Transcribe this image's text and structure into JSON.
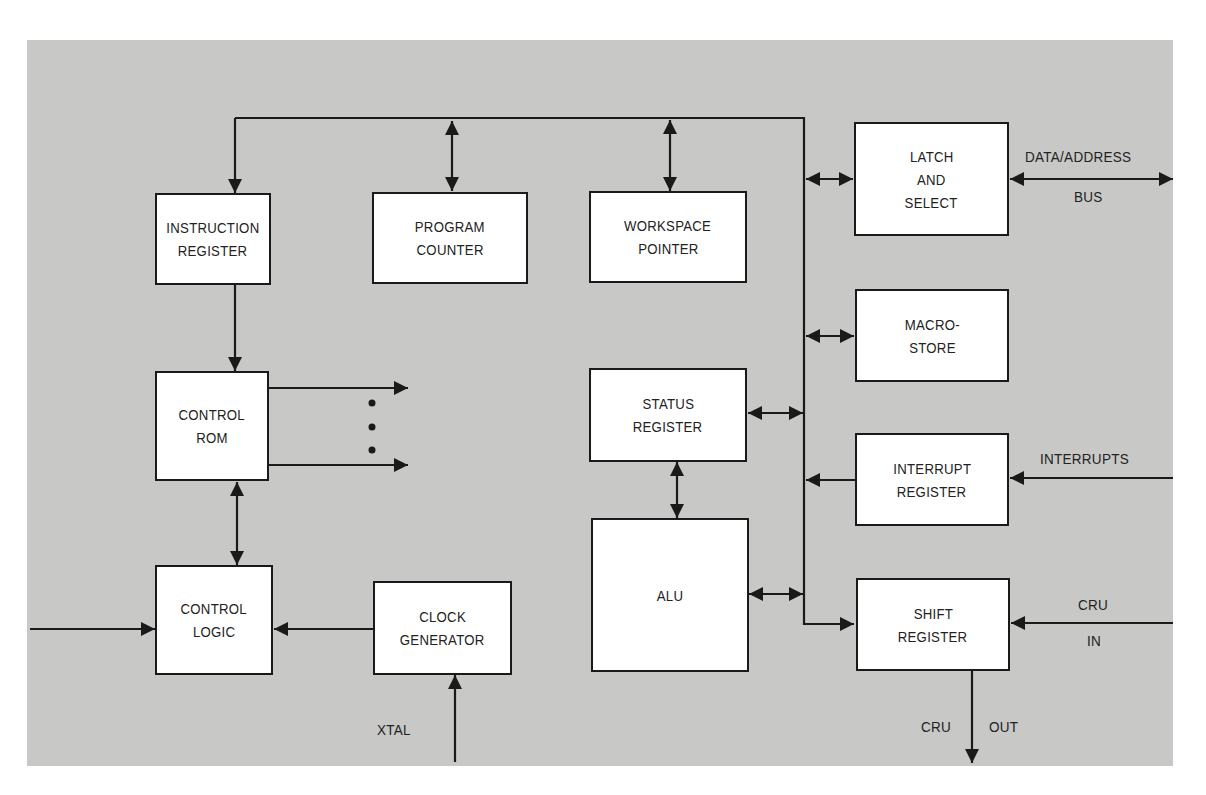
{
  "diagram": {
    "type": "processor block diagram",
    "background_color": "#c8c8c6",
    "line_color": "#1a1a1a",
    "blocks": {
      "instruction_register": {
        "line1": "INSTRUCTION",
        "line2": "REGISTER"
      },
      "program_counter": {
        "line1": "PROGRAM",
        "line2": "COUNTER"
      },
      "workspace_pointer": {
        "line1": "WORKSPACE",
        "line2": "POINTER"
      },
      "latch_select": {
        "line1": "LATCH",
        "line2": "AND",
        "line3": "SELECT"
      },
      "macro_store": {
        "line1": "MACRO-",
        "line2": "STORE"
      },
      "control_rom": {
        "line1": "CONTROL",
        "line2": "ROM"
      },
      "status_register": {
        "line1": "STATUS",
        "line2": "REGISTER"
      },
      "interrupt_register": {
        "line1": "INTERRUPT",
        "line2": "REGISTER"
      },
      "control_logic": {
        "line1": "CONTROL",
        "line2": "LOGIC"
      },
      "clock_generator": {
        "line1": "CLOCK",
        "line2": "GENERATOR"
      },
      "alu": {
        "line1": "ALU"
      },
      "shift_register": {
        "line1": "SHIFT",
        "line2": "REGISTER"
      }
    },
    "signals": {
      "data_address": "DATA/ADDRESS",
      "bus": "BUS",
      "interrupts": "INTERRUPTS",
      "cru_in_top": "CRU",
      "cru_in_bottom": "IN",
      "xtal": "XTAL",
      "cru_out_left": "CRU",
      "cru_out_right": "OUT"
    },
    "connections": [
      {
        "from": "internal bus",
        "to": "INSTRUCTION REGISTER",
        "direction": "one-way"
      },
      {
        "from": "internal bus",
        "to": "PROGRAM COUNTER",
        "direction": "two-way"
      },
      {
        "from": "internal bus",
        "to": "WORKSPACE POINTER",
        "direction": "two-way"
      },
      {
        "from": "internal bus",
        "to": "LATCH AND SELECT",
        "direction": "two-way"
      },
      {
        "from": "LATCH AND SELECT",
        "to": "DATA/ADDRESS BUS",
        "direction": "two-way"
      },
      {
        "from": "internal bus",
        "to": "MACRO-STORE",
        "direction": "two-way"
      },
      {
        "from": "STATUS REGISTER",
        "to": "internal bus",
        "direction": "two-way"
      },
      {
        "from": "INTERRUPT REGISTER",
        "to": "internal bus",
        "direction": "one-way"
      },
      {
        "from": "INTERRUPTS",
        "to": "INTERRUPT REGISTER",
        "direction": "one-way"
      },
      {
        "from": "ALU",
        "to": "internal bus",
        "direction": "two-way"
      },
      {
        "from": "internal bus",
        "to": "SHIFT REGISTER",
        "direction": "one-way"
      },
      {
        "from": "CRU IN",
        "to": "SHIFT REGISTER",
        "direction": "one-way"
      },
      {
        "from": "SHIFT REGISTER",
        "to": "CRU OUT",
        "direction": "one-way"
      },
      {
        "from": "INSTRUCTION REGISTER",
        "to": "CONTROL ROM",
        "direction": "one-way"
      },
      {
        "from": "CONTROL ROM",
        "to": "control outputs",
        "direction": "one-way"
      },
      {
        "from": "CONTROL ROM",
        "to": "CONTROL LOGIC",
        "direction": "two-way"
      },
      {
        "from": "STATUS REGISTER",
        "to": "ALU",
        "direction": "two-way"
      },
      {
        "from": "CLOCK GENERATOR",
        "to": "CONTROL LOGIC",
        "direction": "one-way"
      },
      {
        "from": "XTAL",
        "to": "CLOCK GENERATOR",
        "direction": "one-way"
      },
      {
        "from": "external input",
        "to": "CONTROL LOGIC",
        "direction": "one-way"
      }
    ]
  }
}
